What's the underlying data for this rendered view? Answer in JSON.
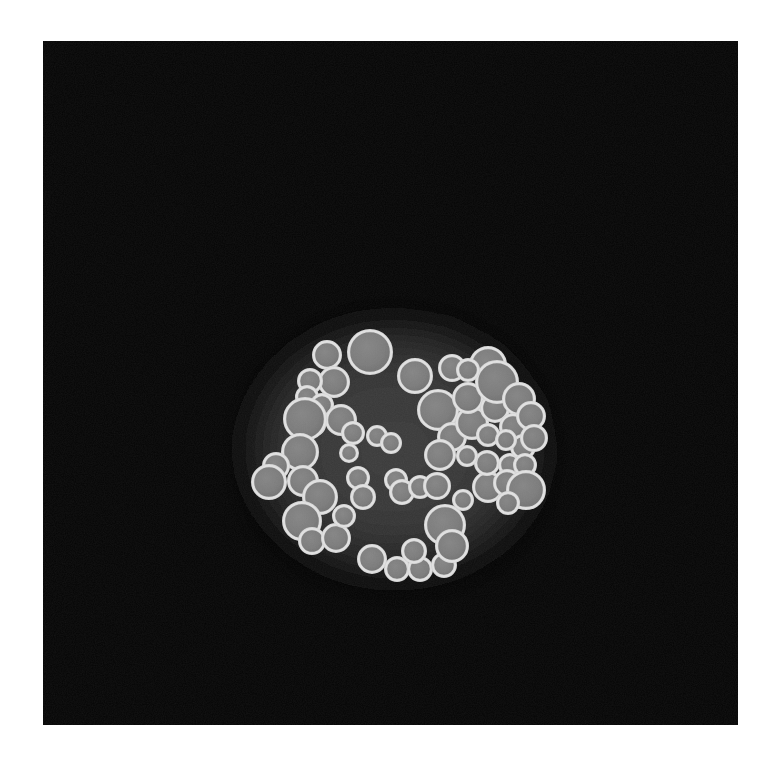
{
  "image": {
    "kind": "micro-ct-cross-section",
    "title": "Tomographic cross-section of packed microsphere agglomerate",
    "page_background": "#ffffff",
    "canvas": {
      "x": 43,
      "y": 41,
      "width": 695,
      "height": 684,
      "background": "#050505"
    },
    "palette": {
      "background": "#050505",
      "matrix_core": "#3a3a3a",
      "matrix_edge": "#0a0a0a",
      "halo": "#262626",
      "particle_core": "#7d7d7d",
      "particle_shell": "#d8d8d8",
      "particle_shell_bright": "#e8e8e8"
    },
    "matrix_region": {
      "description": "rounded-triangular agglomerate silhouette with soft diffuse edge",
      "center_x": 398,
      "center_y": 452,
      "radius_x": 160,
      "radius_y": 150,
      "outline_points": "388,310 452,318 508,348 546,398 556,455 540,520 498,566 432,588 360,588 300,572 258,536 236,486 234,432 254,375 300,334 344,315"
    },
    "particles": {
      "count": 62,
      "shell_thickness": 3.2,
      "radius_min": 10,
      "radius_max": 24,
      "list": [
        {
          "id": 1,
          "cx": 327,
          "cy": 355,
          "r": 15
        },
        {
          "id": 2,
          "cx": 370,
          "cy": 352,
          "r": 23
        },
        {
          "id": 3,
          "cx": 334,
          "cy": 382,
          "r": 16
        },
        {
          "id": 4,
          "cx": 415,
          "cy": 376,
          "r": 18
        },
        {
          "id": 5,
          "cx": 452,
          "cy": 368,
          "r": 14
        },
        {
          "id": 6,
          "cx": 488,
          "cy": 365,
          "r": 19
        },
        {
          "id": 7,
          "cx": 310,
          "cy": 381,
          "r": 13
        },
        {
          "id": 8,
          "cx": 307,
          "cy": 397,
          "r": 12
        },
        {
          "id": 9,
          "cx": 322,
          "cy": 405,
          "r": 12
        },
        {
          "id": 10,
          "cx": 341,
          "cy": 420,
          "r": 16
        },
        {
          "id": 11,
          "cx": 315,
          "cy": 425,
          "r": 11
        },
        {
          "id": 12,
          "cx": 353,
          "cy": 433,
          "r": 12
        },
        {
          "id": 13,
          "cx": 377,
          "cy": 436,
          "r": 11
        },
        {
          "id": 14,
          "cx": 391,
          "cy": 443,
          "r": 11
        },
        {
          "id": 15,
          "cx": 305,
          "cy": 419,
          "r": 22
        },
        {
          "id": 16,
          "cx": 300,
          "cy": 452,
          "r": 19
        },
        {
          "id": 17,
          "cx": 276,
          "cy": 466,
          "r": 14
        },
        {
          "id": 18,
          "cx": 269,
          "cy": 482,
          "r": 18
        },
        {
          "id": 19,
          "cx": 303,
          "cy": 481,
          "r": 16
        },
        {
          "id": 20,
          "cx": 320,
          "cy": 497,
          "r": 18
        },
        {
          "id": 21,
          "cx": 302,
          "cy": 521,
          "r": 20
        },
        {
          "id": 22,
          "cx": 312,
          "cy": 541,
          "r": 14
        },
        {
          "id": 23,
          "cx": 336,
          "cy": 538,
          "r": 15
        },
        {
          "id": 24,
          "cx": 358,
          "cy": 478,
          "r": 12
        },
        {
          "id": 25,
          "cx": 363,
          "cy": 497,
          "r": 13
        },
        {
          "id": 26,
          "cx": 396,
          "cy": 480,
          "r": 12
        },
        {
          "id": 27,
          "cx": 402,
          "cy": 492,
          "r": 13
        },
        {
          "id": 28,
          "cx": 420,
          "cy": 487,
          "r": 12
        },
        {
          "id": 29,
          "cx": 372,
          "cy": 559,
          "r": 15
        },
        {
          "id": 30,
          "cx": 397,
          "cy": 569,
          "r": 13
        },
        {
          "id": 31,
          "cx": 420,
          "cy": 569,
          "r": 13
        },
        {
          "id": 32,
          "cx": 444,
          "cy": 565,
          "r": 13
        },
        {
          "id": 33,
          "cx": 414,
          "cy": 551,
          "r": 13
        },
        {
          "id": 34,
          "cx": 437,
          "cy": 486,
          "r": 14
        },
        {
          "id": 35,
          "cx": 438,
          "cy": 410,
          "r": 21
        },
        {
          "id": 36,
          "cx": 452,
          "cy": 437,
          "r": 15
        },
        {
          "id": 37,
          "cx": 440,
          "cy": 455,
          "r": 16
        },
        {
          "id": 38,
          "cx": 445,
          "cy": 525,
          "r": 21
        },
        {
          "id": 39,
          "cx": 452,
          "cy": 546,
          "r": 17
        },
        {
          "id": 40,
          "cx": 472,
          "cy": 423,
          "r": 17
        },
        {
          "id": 41,
          "cx": 468,
          "cy": 398,
          "r": 16
        },
        {
          "id": 42,
          "cx": 495,
          "cy": 408,
          "r": 15
        },
        {
          "id": 43,
          "cx": 497,
          "cy": 382,
          "r": 22
        },
        {
          "id": 44,
          "cx": 519,
          "cy": 399,
          "r": 17
        },
        {
          "id": 45,
          "cx": 513,
          "cy": 427,
          "r": 14
        },
        {
          "id": 46,
          "cx": 488,
          "cy": 487,
          "r": 16
        },
        {
          "id": 47,
          "cx": 487,
          "cy": 463,
          "r": 13
        },
        {
          "id": 48,
          "cx": 510,
          "cy": 465,
          "r": 12
        },
        {
          "id": 49,
          "cx": 507,
          "cy": 483,
          "r": 14
        },
        {
          "id": 50,
          "cx": 523,
          "cy": 447,
          "r": 13
        },
        {
          "id": 51,
          "cx": 531,
          "cy": 416,
          "r": 15
        },
        {
          "id": 52,
          "cx": 525,
          "cy": 465,
          "r": 12
        },
        {
          "id": 53,
          "cx": 526,
          "cy": 490,
          "r": 20
        },
        {
          "id": 54,
          "cx": 534,
          "cy": 438,
          "r": 14
        },
        {
          "id": 55,
          "cx": 508,
          "cy": 503,
          "r": 12
        },
        {
          "id": 56,
          "cx": 488,
          "cy": 435,
          "r": 12
        },
        {
          "id": 57,
          "cx": 463,
          "cy": 500,
          "r": 11
        },
        {
          "id": 58,
          "cx": 349,
          "cy": 453,
          "r": 10
        },
        {
          "id": 59,
          "cx": 467,
          "cy": 456,
          "r": 11
        },
        {
          "id": 60,
          "cx": 506,
          "cy": 440,
          "r": 11
        },
        {
          "id": 61,
          "cx": 344,
          "cy": 516,
          "r": 12
        },
        {
          "id": 62,
          "cx": 468,
          "cy": 370,
          "r": 12
        }
      ]
    }
  }
}
